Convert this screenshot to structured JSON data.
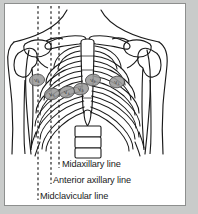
{
  "figure": {
    "type": "anatomical-illustration",
    "colors": {
      "frame": "#c9cbca",
      "plate_background": "#ffffff",
      "outline": "#1a1a1a",
      "electrode_fill": "#9a9a9a",
      "electrode_stroke": "#4a4a4a",
      "guide_line": "#1a1a1a",
      "text": "#1a1a1a"
    }
  },
  "guide_lines": [
    {
      "id": "midaxillary",
      "label": "Midaxillary line",
      "x": 39,
      "style": "dashed"
    },
    {
      "id": "anterior-axillary",
      "label": "Anterior axillary line",
      "x": 52,
      "style": "dashed"
    },
    {
      "id": "midclavicular",
      "label": "Midclavicular line",
      "x": 60,
      "style": "dashed"
    }
  ],
  "labels": {
    "midaxillary": "Midaxillary line",
    "anterior_axillary": "Anterior axillary line",
    "midclavicular": "Midclavicular line"
  },
  "electrodes": [
    {
      "id": "V1",
      "label": "V",
      "subscript": "1",
      "cx": 118,
      "cy": 81,
      "rx": 7.5,
      "ry": 5.8,
      "rotation": -8
    },
    {
      "id": "V2",
      "label": "V",
      "subscript": "2",
      "cx": 91,
      "cy": 79,
      "rx": 7.5,
      "ry": 5.8,
      "rotation": -8
    },
    {
      "id": "V3",
      "label": "V",
      "subscript": "3",
      "cx": 80,
      "cy": 87,
      "rx": 7.5,
      "ry": 5.8,
      "rotation": -10
    },
    {
      "id": "V4",
      "label": "V",
      "subscript": "4",
      "cx": 66,
      "cy": 90,
      "rx": 7.5,
      "ry": 5.8,
      "rotation": -10
    },
    {
      "id": "V5",
      "label": "V",
      "subscript": "5",
      "cx": 51,
      "cy": 92,
      "rx": 7.5,
      "ry": 5.8,
      "rotation": -10
    },
    {
      "id": "V6",
      "label": "V",
      "subscript": "6",
      "cx": 37,
      "cy": 79,
      "rx": 7.5,
      "ry": 5.8,
      "rotation": -8
    }
  ],
  "anatomy": {
    "parts": [
      "clavicle-left",
      "clavicle-right",
      "scapula-left",
      "scapula-right",
      "humerus-left",
      "humerus-right",
      "sternum",
      "xiphoid-process",
      "ribs",
      "costal-margin",
      "vertebral-column",
      "torso-outline"
    ]
  }
}
